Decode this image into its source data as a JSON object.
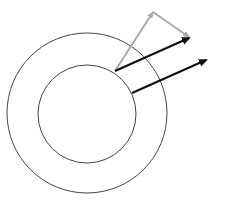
{
  "diagram": {
    "width": 227,
    "height": 208,
    "background": "#ffffff",
    "circles": [
      {
        "name": "outer-circle",
        "cx": 87,
        "cy": 113,
        "r": 80,
        "stroke": "#444444"
      },
      {
        "name": "inner-circle",
        "cx": 87,
        "cy": 114,
        "r": 49,
        "stroke": "#444444"
      }
    ],
    "arrows": [
      {
        "name": "gray-component-arrow-1",
        "x1": 115,
        "y1": 71,
        "x2": 153,
        "y2": 12,
        "color": "#aaaaaa",
        "width": 2
      },
      {
        "name": "gray-component-arrow-2",
        "x1": 153,
        "y1": 12,
        "x2": 189,
        "y2": 37,
        "color": "#aaaaaa",
        "width": 2
      },
      {
        "name": "black-resultant-arrow-1",
        "x1": 115,
        "y1": 71,
        "x2": 189,
        "y2": 38,
        "color": "#111111",
        "width": 2.2
      },
      {
        "name": "black-resultant-arrow-2",
        "x1": 132,
        "y1": 93,
        "x2": 206,
        "y2": 60,
        "color": "#111111",
        "width": 2.2
      }
    ]
  }
}
